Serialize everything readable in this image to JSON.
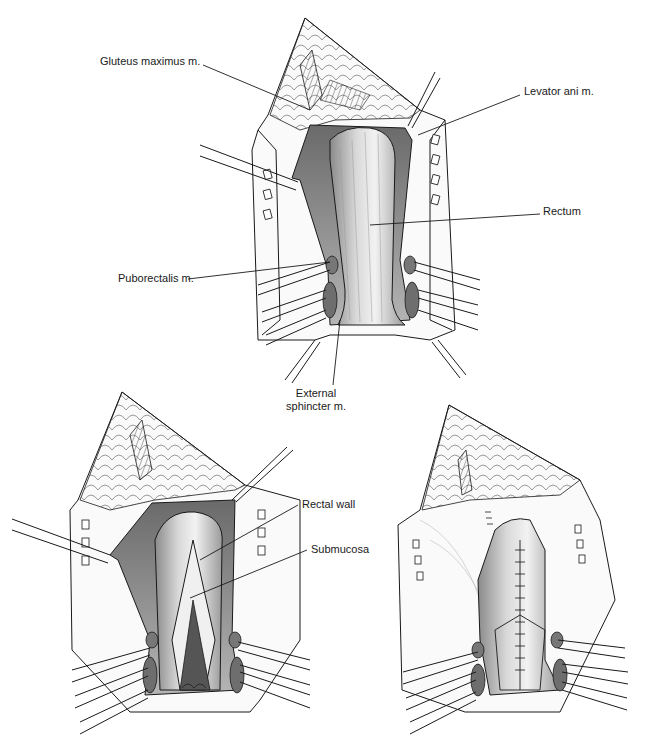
{
  "figure": {
    "panels": [
      {
        "id": "top",
        "description": "Exposure of rectum with retracted muscles",
        "labels": [
          {
            "text": "Gluteus maximus m.",
            "x": 100,
            "y": 61
          },
          {
            "text": "Levator ani m.",
            "x": 524,
            "y": 91
          },
          {
            "text": "Rectum",
            "x": 543,
            "y": 210
          },
          {
            "text": "Puborectalis m.",
            "x": 118,
            "y": 274
          },
          {
            "text": "External\nsphincter m.",
            "line1": "External",
            "line2": "sphincter m.",
            "x": 276,
            "y": 389
          }
        ]
      },
      {
        "id": "bottom-left",
        "description": "Incision of rectal wall exposing submucosa",
        "labels": [
          {
            "text": "Rectal wall",
            "x": 302,
            "y": 499
          },
          {
            "text": "Submucosa",
            "x": 311,
            "y": 544
          }
        ]
      },
      {
        "id": "bottom-right",
        "description": "Sutured closure of rectal wall",
        "labels": []
      }
    ],
    "colors": {
      "line": "#1a1a1a",
      "shade_dark": "#6e6e6e",
      "shade_mid": "#a8a8a8",
      "shade_light": "#dcdcdc",
      "background": "#ffffff"
    }
  }
}
